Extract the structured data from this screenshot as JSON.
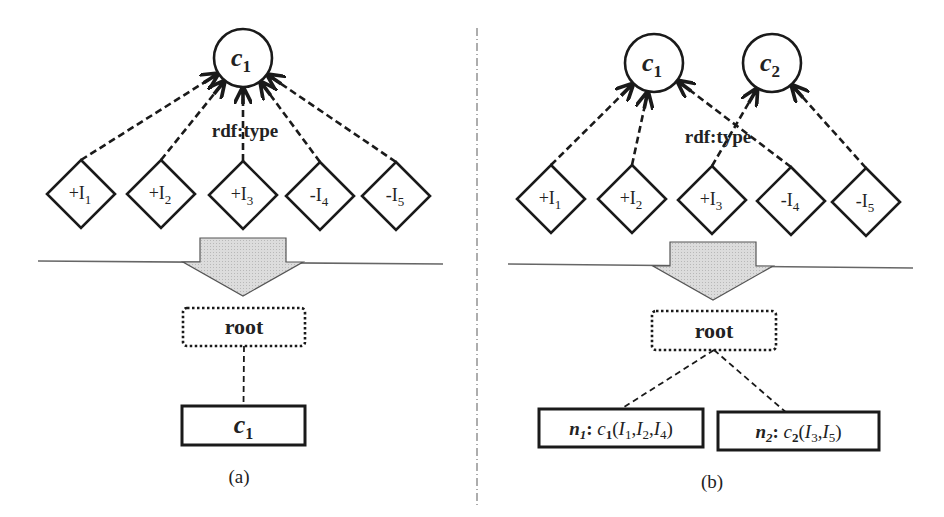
{
  "colors": {
    "stroke": "#1a1a1a",
    "arrow_fill": "#d9d9d9",
    "divider": "#777777",
    "separator": "#666666",
    "background": "#ffffff"
  },
  "panels": [
    {
      "id": "a",
      "caption": "(a)",
      "classes": [
        {
          "label": "c",
          "sub": "1",
          "cx": 243,
          "cy": 58
        }
      ],
      "edge_label": {
        "text": "rdf:type",
        "x": 245,
        "y": 137
      },
      "instances": [
        {
          "sign": "+",
          "label": "I",
          "sub": "1",
          "cx": 81,
          "cy": 194,
          "target": 0
        },
        {
          "sign": "+",
          "label": "I",
          "sub": "2",
          "cx": 161,
          "cy": 194,
          "target": 0
        },
        {
          "sign": "+",
          "label": "I",
          "sub": "3",
          "cx": 243,
          "cy": 195,
          "target": 0
        },
        {
          "sign": "-",
          "label": "I",
          "sub": "4",
          "cx": 320,
          "cy": 196,
          "target": 0
        },
        {
          "sign": "-",
          "label": "I",
          "sub": "5",
          "cx": 396,
          "cy": 196,
          "target": 0
        }
      ],
      "separator": {
        "x1": 38,
        "y1": 261,
        "x2": 443,
        "y2": 264
      },
      "arrow": {
        "cx": 243,
        "shaft_top": 238,
        "head_top": 262,
        "tip": 296,
        "shaft_half": 43,
        "head_half": 60
      },
      "root": {
        "label": "root",
        "x": 183,
        "y": 308,
        "w": 122,
        "h": 38
      },
      "leaves": [
        {
          "text_main": "c",
          "text_sub": "1",
          "x": 182,
          "y": 406,
          "w": 123,
          "h": 39
        }
      ],
      "caption_pos": {
        "x": 239,
        "y": 483
      }
    },
    {
      "id": "b",
      "caption": "(b)",
      "classes": [
        {
          "label": "c",
          "sub": "1",
          "cx": 654,
          "cy": 63
        },
        {
          "label": "c",
          "sub": "2",
          "cx": 772,
          "cy": 63
        }
      ],
      "edge_label": {
        "text": "rdf:type",
        "x": 718,
        "y": 143
      },
      "instances": [
        {
          "sign": "+",
          "label": "I",
          "sub": "1",
          "cx": 551,
          "cy": 199,
          "target": 0
        },
        {
          "sign": "+",
          "label": "I",
          "sub": "2",
          "cx": 632,
          "cy": 199,
          "target": 0
        },
        {
          "sign": "+",
          "label": "I",
          "sub": "3",
          "cx": 712,
          "cy": 200,
          "target": 1
        },
        {
          "sign": "-",
          "label": "I",
          "sub": "4",
          "cx": 791,
          "cy": 201,
          "target": 0
        },
        {
          "sign": "-",
          "label": "I",
          "sub": "5",
          "cx": 866,
          "cy": 202,
          "target": 1
        }
      ],
      "separator": {
        "x1": 508,
        "y1": 264,
        "x2": 913,
        "y2": 268
      },
      "arrow": {
        "cx": 713,
        "shaft_top": 242,
        "head_top": 266,
        "tip": 300,
        "shaft_half": 43,
        "head_half": 60
      },
      "root": {
        "label": "root",
        "x": 652,
        "y": 311,
        "w": 124,
        "h": 39
      },
      "leaves": [
        {
          "node": "n",
          "node_sub": "1",
          "cls": "c",
          "cls_sub": "1",
          "members": [
            "1",
            "2",
            "4"
          ],
          "x": 539,
          "y": 409,
          "w": 164,
          "h": 38
        },
        {
          "node": "n",
          "node_sub": "2",
          "cls": "c",
          "cls_sub": "2",
          "members": [
            "3",
            "5"
          ],
          "x": 718,
          "y": 412,
          "w": 161,
          "h": 38
        }
      ],
      "caption_pos": {
        "x": 712,
        "y": 488
      }
    }
  ],
  "divider": {
    "x": 477,
    "y1": 28,
    "y2": 505
  },
  "texts": {
    "panel_a": {
      "class_c1": "c",
      "class_c1_sub": "1",
      "edge_label": "rdf:type",
      "instances": [
        "+I1",
        "+I2",
        "+I3",
        "-I4",
        "-I5"
      ],
      "root": "root",
      "leaf": "c1",
      "caption": "(a)"
    },
    "panel_b": {
      "class_c1": "c1",
      "class_c2": "c2",
      "edge_label": "rdf:type",
      "instances": [
        "+I1",
        "+I2",
        "+I3",
        "-I4",
        "-I5"
      ],
      "root": "root",
      "leaf_1": "n1: c1(I1,I2,I4)",
      "leaf_2": "n2: c2(I3,I5)",
      "caption": "(b)"
    }
  }
}
